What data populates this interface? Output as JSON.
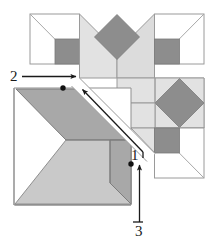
{
  "figure": {
    "canvas": {
      "width": 217,
      "height": 243
    },
    "colors": {
      "background": "#ffffff",
      "light_gray": "#e2e2e2",
      "light_gray_alt": "#dcdcdc",
      "mid_gray": "#c9c9c9",
      "dark_gray": "#8d8d8d",
      "darker_gray": "#8a8a8a",
      "outline": "#9a9a9a",
      "outline_strong": "#6e6e6e",
      "arrow": "#1a1a1a",
      "label_text": "#1a1a1a"
    },
    "labels": [
      {
        "id": "label-1",
        "text": "1",
        "x": 131,
        "y": 158
      },
      {
        "id": "label-2",
        "text": "2",
        "x": 10,
        "y": 79
      },
      {
        "id": "label-3",
        "text": "3",
        "x": 136,
        "y": 231
      }
    ],
    "arrows": [
      {
        "id": "arrow-1",
        "label": "1",
        "description": "long diagonal arrow pointing up-left along the fold crease",
        "x1": 143,
        "y1": 152,
        "x2": 80,
        "y2": 87
      },
      {
        "id": "arrow-2",
        "label": "2",
        "description": "horizontal arrow pointing right toward the crease",
        "x1": 22,
        "y1": 76,
        "x2": 78,
        "y2": 76
      },
      {
        "id": "arrow-3",
        "label": "3",
        "description": "vertical arrow pointing up along the right edge",
        "x1": 139,
        "y1": 222,
        "x2": 139,
        "y2": 161
      }
    ],
    "dots": [
      {
        "id": "pivot-dot-upper",
        "cx": 63,
        "cy": 88,
        "r": 2.6
      },
      {
        "id": "pivot-dot-lower",
        "cx": 131,
        "cy": 164,
        "r": 2.6
      }
    ],
    "shapes": {
      "top_left_block": {
        "name": "top-left-square-panel",
        "outline": "30,14 79,14 79,64 30,64",
        "diagonal": "30,14 79,64",
        "dark_square": "55,39 79,39 79,64 55,64"
      },
      "top_center_block": {
        "name": "top-center-chevron-panel",
        "left_wing": "79,14 117,52 117,78 79,78",
        "right_wing": "117,52 155,14 155,78 117,78",
        "dark_diamond": "117,14 140,37 117,60 94,37"
      },
      "top_right_block": {
        "name": "top-right-square-panel",
        "outline": "155,14 204,14 204,64 155,64",
        "diagonal": "155,64 204,14",
        "dark_square": "155,39 180,39 180,64 155,64"
      },
      "mid_right_block": {
        "name": "mid-right-diamond-panel",
        "light_field": "117,78 155,78 204,78 204,128 155,128 117,128",
        "dark_diamond": "180,78 204,103 180,128 155,103"
      },
      "bottom_right_block": {
        "name": "bottom-right-square-panel",
        "outline": "155,128 204,128 204,178 155,178",
        "diagonal": "155,128 204,178",
        "dark_square": "155,128 180,128 180,153 155,153"
      },
      "folded_flap": {
        "name": "bottom-left-folded-flap",
        "outer_square": "14,88 131,88 131,205 14,205",
        "dark_upper_parallelogram": "16,88 80,88 131,139 66,139",
        "mid_large_triangle": "16,205 66,139 131,139 131,205",
        "dark_right_band": "110,139 131,139 131,205 110,185",
        "crease_line": "16,88 131,205"
      },
      "fold_gap_band": {
        "name": "fold-crease-gap",
        "points": "79,78 131,130 143,143 155,155"
      }
    }
  }
}
